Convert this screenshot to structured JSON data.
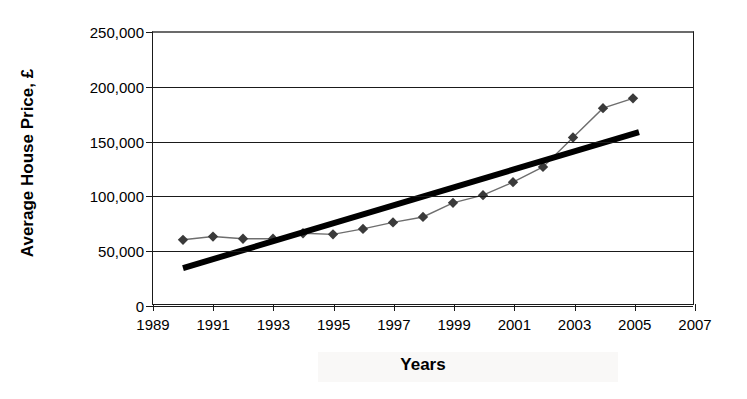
{
  "chart_data": {
    "type": "line",
    "title": "",
    "xlabel": "Years",
    "ylabel": "Average House Price, £",
    "xlim": [
      1989,
      2007
    ],
    "ylim": [
      0,
      250000
    ],
    "grid": true,
    "legend": "none",
    "x_ticks": [
      "1989",
      "1991",
      "1993",
      "1995",
      "1997",
      "1999",
      "2001",
      "2003",
      "2005",
      "2007"
    ],
    "x_tick_values": [
      1989,
      1991,
      1993,
      1995,
      1997,
      1999,
      2001,
      2003,
      2005,
      2007
    ],
    "y_ticks": [
      "0",
      "50,000",
      "100,000",
      "150,000",
      "200,000",
      "250,000"
    ],
    "y_tick_values": [
      0,
      50000,
      100000,
      150000,
      200000,
      250000
    ],
    "x": [
      1990,
      1991,
      1992,
      1993,
      1994,
      1995,
      1996,
      1997,
      1998,
      1999,
      2000,
      2001,
      2002,
      2003,
      2004,
      2005
    ],
    "series": [
      {
        "name": "Average House Price",
        "marker": "diamond",
        "color": "#3a3a3a",
        "values": [
          59000,
          62000,
          60000,
          60000,
          65000,
          64000,
          69000,
          75000,
          80000,
          93000,
          100000,
          112000,
          126000,
          153000,
          180000,
          189000
        ]
      },
      {
        "name": "Linear trend line",
        "marker": "none",
        "color": "#000000",
        "type": "trendline",
        "x_start": 1990,
        "y_start": 33000,
        "x_end": 2005.2,
        "y_end": 158000
      }
    ]
  },
  "axes": {
    "y_title": "Average House Price, £",
    "x_title": "Years"
  }
}
